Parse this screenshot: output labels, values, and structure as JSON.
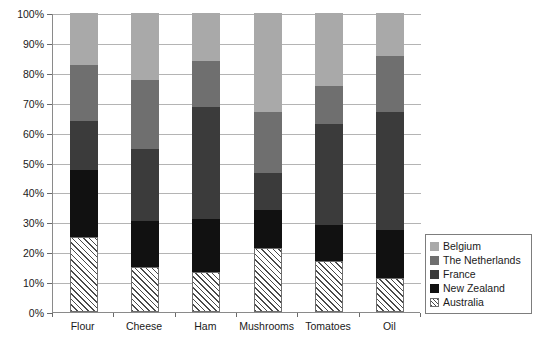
{
  "chart_data": {
    "type": "bar",
    "subtype": "stacked-bar-100-percent",
    "title": "",
    "subtitle": "",
    "xlabel": "",
    "ylabel": "",
    "categories": [
      "Flour",
      "Cheese",
      "Ham",
      "Mushrooms",
      "Tomatoes",
      "Oil"
    ],
    "ylim": [
      0,
      100
    ],
    "ytick_labels": [
      "0%",
      "10%",
      "20%",
      "30%",
      "40%",
      "50%",
      "60%",
      "70%",
      "80%",
      "90%",
      "100%"
    ],
    "ytick_values": [
      0,
      10,
      20,
      30,
      40,
      50,
      60,
      70,
      80,
      90,
      100
    ],
    "grid": true,
    "grid_axis": "y",
    "legend_position": "right-bottom",
    "stack_order_bottom_to_top": [
      "Australia",
      "New Zealand",
      "France",
      "The Netherlands",
      "Belgium"
    ],
    "series": [
      {
        "name": "Australia",
        "color": "#ffffff",
        "pattern": "diagonal-hatch",
        "values": [
          25.0,
          15.0,
          13.5,
          21.5,
          17.0,
          11.5
        ]
      },
      {
        "name": "New Zealand",
        "color": "#111111",
        "pattern": "solid",
        "values": [
          22.5,
          15.5,
          17.5,
          12.5,
          12.0,
          16.0
        ]
      },
      {
        "name": "France",
        "color": "#3b3b3b",
        "pattern": "solid",
        "values": [
          16.5,
          24.0,
          37.5,
          12.5,
          34.0,
          39.5
        ]
      },
      {
        "name": "The Netherlands",
        "color": "#6f6f6f",
        "pattern": "solid",
        "values": [
          18.5,
          23.0,
          15.5,
          20.5,
          12.5,
          18.5
        ]
      },
      {
        "name": "Belgium",
        "color": "#a9a9a9",
        "pattern": "solid",
        "values": [
          17.5,
          22.5,
          16.0,
          33.0,
          24.5,
          14.5
        ]
      }
    ],
    "cumulative_tops": {
      "Flour": {
        "Australia": 25.0,
        "New Zealand": 47.5,
        "France": 64.0,
        "The Netherlands": 82.5,
        "Belgium": 100
      },
      "Cheese": {
        "Australia": 15.0,
        "New Zealand": 30.5,
        "France": 54.5,
        "The Netherlands": 77.5,
        "Belgium": 100
      },
      "Ham": {
        "Australia": 13.5,
        "New Zealand": 31.0,
        "France": 68.5,
        "The Netherlands": 84.0,
        "Belgium": 100
      },
      "Mushrooms": {
        "Australia": 21.5,
        "New Zealand": 34.0,
        "France": 46.5,
        "The Netherlands": 67.0,
        "Belgium": 100
      },
      "Tomatoes": {
        "Australia": 17.0,
        "New Zealand": 29.0,
        "France": 63.0,
        "The Netherlands": 75.5,
        "Belgium": 100
      },
      "Oil": {
        "Australia": 11.5,
        "New Zealand": 27.5,
        "France": 67.0,
        "The Netherlands": 85.5,
        "Belgium": 100
      }
    }
  },
  "legend": {
    "items": [
      {
        "label": "Belgium",
        "swatch": "light-gray-swatch"
      },
      {
        "label": "The Netherlands",
        "swatch": "medium-gray-swatch"
      },
      {
        "label": "France",
        "swatch": "dark-gray-swatch"
      },
      {
        "label": "New Zealand",
        "swatch": "black-swatch"
      },
      {
        "label": "Australia",
        "swatch": "hatched-swatch"
      }
    ]
  }
}
